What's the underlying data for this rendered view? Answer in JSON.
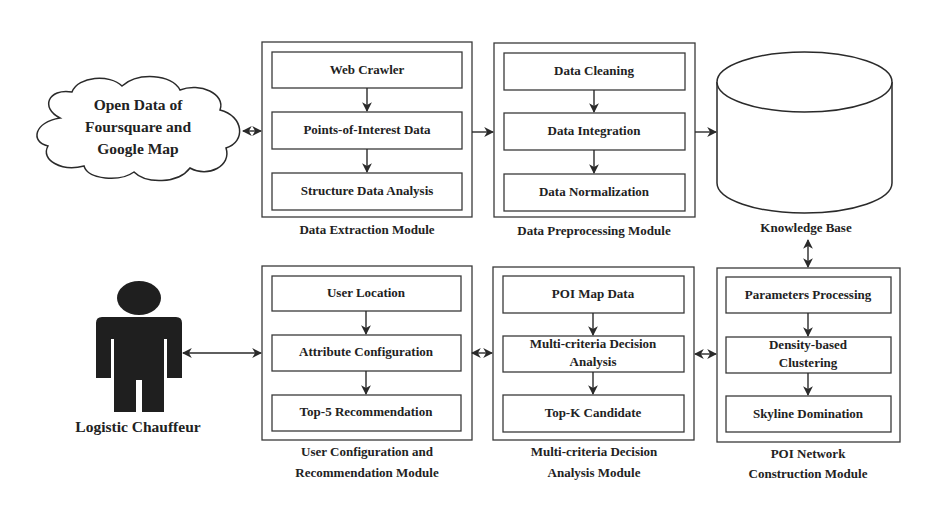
{
  "diagram": {
    "colors": {
      "stroke": "#3a3a3a",
      "text": "#222222",
      "person": "#1f1f1f",
      "background": "#ffffff"
    },
    "source": {
      "label_lines": [
        "Open Data of",
        "Foursquare and",
        "Google Map"
      ],
      "icon": "cloud-icon"
    },
    "actor": {
      "label": "Logistic Chauffeur",
      "icon": "person-icon"
    },
    "knowledge_base": {
      "label": "Knowledge Base",
      "icon": "database-cylinder-icon"
    },
    "modules": [
      {
        "id": "data-extraction",
        "label_lines": [
          "Data Extraction Module"
        ],
        "steps": [
          {
            "lines": [
              "Web Crawler"
            ]
          },
          {
            "lines": [
              "Points-of-Interest Data"
            ]
          },
          {
            "lines": [
              "Structure Data Analysis"
            ]
          }
        ]
      },
      {
        "id": "data-preprocessing",
        "label_lines": [
          "Data Preprocessing Module"
        ],
        "steps": [
          {
            "lines": [
              "Data Cleaning"
            ]
          },
          {
            "lines": [
              "Data Integration"
            ]
          },
          {
            "lines": [
              "Data Normalization"
            ]
          }
        ]
      },
      {
        "id": "user-configuration",
        "label_lines": [
          "User Configuration and",
          "Recommendation Module"
        ],
        "steps": [
          {
            "lines": [
              "User Location"
            ]
          },
          {
            "lines": [
              "Attribute Configuration"
            ]
          },
          {
            "lines": [
              "Top-5 Recommendation"
            ]
          }
        ]
      },
      {
        "id": "mcda",
        "label_lines": [
          "Multi-criteria Decision",
          "Analysis Module"
        ],
        "steps": [
          {
            "lines": [
              "POI Map Data"
            ]
          },
          {
            "lines": [
              "Multi-criteria Decision",
              "Analysis"
            ]
          },
          {
            "lines": [
              "Top-K Candidate"
            ]
          }
        ]
      },
      {
        "id": "poi-network",
        "label_lines": [
          "POI Network",
          "Construction Module"
        ],
        "steps": [
          {
            "lines": [
              "Parameters Processing"
            ]
          },
          {
            "lines": [
              "Density-based",
              "Clustering"
            ]
          },
          {
            "lines": [
              "Skyline Domination"
            ]
          }
        ]
      }
    ],
    "connections": [
      {
        "from": "source",
        "to": "data-extraction",
        "type": "bidirectional"
      },
      {
        "from": "data-extraction",
        "to": "data-preprocessing",
        "type": "directed"
      },
      {
        "from": "data-preprocessing",
        "to": "knowledge_base",
        "type": "directed"
      },
      {
        "from": "knowledge_base",
        "to": "poi-network",
        "type": "bidirectional"
      },
      {
        "from": "poi-network",
        "to": "mcda",
        "type": "bidirectional"
      },
      {
        "from": "mcda",
        "to": "user-configuration",
        "type": "bidirectional"
      },
      {
        "from": "user-configuration",
        "to": "actor",
        "type": "bidirectional"
      }
    ]
  }
}
